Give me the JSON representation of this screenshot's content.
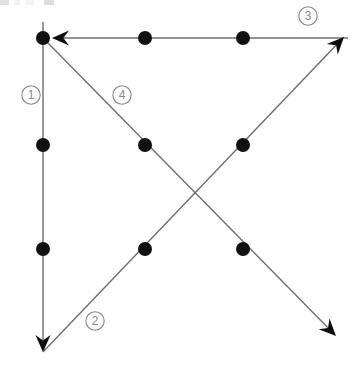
{
  "figure": {
    "kind": "directed-path-diagram",
    "background_color": "#ffffff",
    "node_color": "#111111",
    "edge_color": "#6e6e6e",
    "label_color": "#8a8a8a",
    "node_radius": 7,
    "edge_width": 1.4,
    "width": 357,
    "height": 370
  },
  "nodes": [
    {
      "id": "n-top-left",
      "name": "node-r0-c0",
      "x": 43,
      "y": 38,
      "row": 0,
      "col": 0
    },
    {
      "id": "n-top-center",
      "name": "node-r0-c1",
      "x": 145,
      "y": 38,
      "row": 0,
      "col": 1
    },
    {
      "id": "n-top-right",
      "name": "node-r0-c2",
      "x": 243,
      "y": 38,
      "row": 0,
      "col": 2
    },
    {
      "id": "n-mid-left",
      "name": "node-r1-c0",
      "x": 43,
      "y": 145,
      "row": 1,
      "col": 0
    },
    {
      "id": "n-mid-center",
      "name": "node-r1-c1",
      "x": 145,
      "y": 145,
      "row": 1,
      "col": 1
    },
    {
      "id": "n-mid-right",
      "name": "node-r1-c2",
      "x": 243,
      "y": 145,
      "row": 1,
      "col": 2
    },
    {
      "id": "n-low-left",
      "name": "node-r2-c0",
      "x": 43,
      "y": 249,
      "row": 2,
      "col": 0
    },
    {
      "id": "n-low-center",
      "name": "node-r2-c1",
      "x": 145,
      "y": 249,
      "row": 2,
      "col": 1
    },
    {
      "id": "n-low-right",
      "name": "node-r2-c2",
      "x": 243,
      "y": 249,
      "row": 2,
      "col": 2
    }
  ],
  "paths": [
    {
      "id": "path-1",
      "name": "path-1-vertical-down",
      "label": "1",
      "direction": "down",
      "from": {
        "x": 43,
        "y": 22
      },
      "to": {
        "x": 43,
        "y": 352
      },
      "arrow_at": "end",
      "passes_nodes": [
        "n-top-left",
        "n-mid-left",
        "n-low-left"
      ]
    },
    {
      "id": "path-2",
      "name": "path-2-diagonal-up-right",
      "label": "2",
      "direction": "up-right",
      "from": {
        "x": 43,
        "y": 352
      },
      "to": {
        "x": 344,
        "y": 37
      },
      "arrow_at": "end",
      "passes_nodes": [
        "n-low-center",
        "n-mid-right"
      ]
    },
    {
      "id": "path-3",
      "name": "path-3-horizontal-left",
      "label": "3",
      "direction": "left",
      "from": {
        "x": 348,
        "y": 38
      },
      "to": {
        "x": 52,
        "y": 38
      },
      "arrow_at": "end",
      "passes_nodes": [
        "n-top-right",
        "n-top-center"
      ]
    },
    {
      "id": "path-4",
      "name": "path-4-diagonal-down-right",
      "label": "4",
      "direction": "down-right",
      "from": {
        "x": 47,
        "y": 42
      },
      "to": {
        "x": 336,
        "y": 336
      },
      "arrow_at": "end",
      "passes_nodes": [
        "n-mid-center",
        "n-low-right"
      ]
    }
  ],
  "path_labels": [
    {
      "id": "label-1",
      "name": "path-label-1",
      "text": "1",
      "x": 31,
      "y": 95
    },
    {
      "id": "label-2",
      "name": "path-label-2",
      "text": "2",
      "x": 95,
      "y": 321
    },
    {
      "id": "label-3",
      "name": "path-label-3",
      "text": "3",
      "x": 308,
      "y": 16
    },
    {
      "id": "label-4",
      "name": "path-label-4",
      "text": "4",
      "x": 122,
      "y": 95
    }
  ],
  "crossing_point": {
    "name": "path-crossing",
    "x": 194,
    "y": 197
  }
}
